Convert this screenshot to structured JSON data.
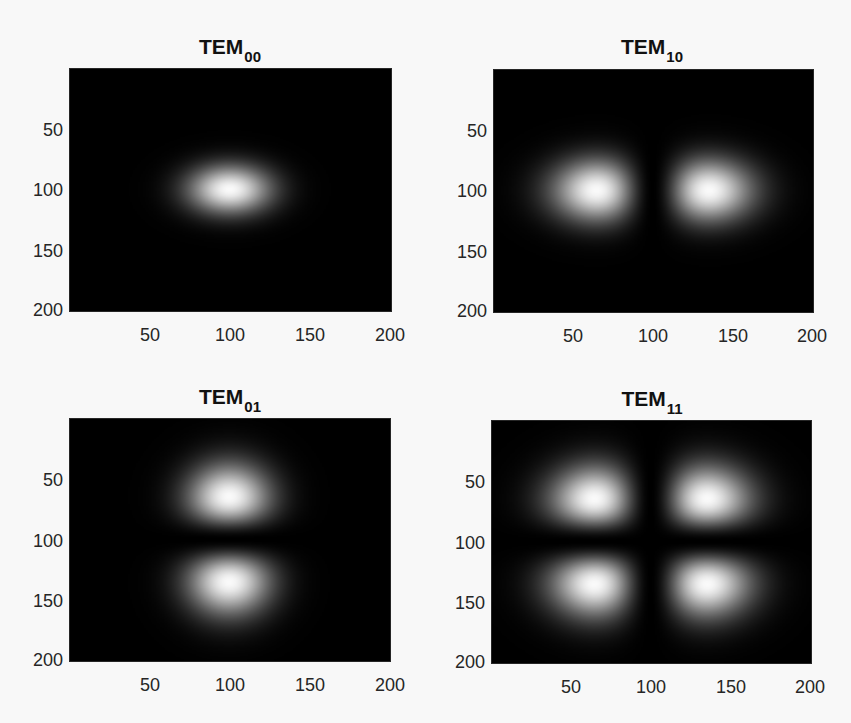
{
  "figure": {
    "background": "#f8f8f8",
    "colormap": "gray"
  },
  "chart_data": [
    {
      "type": "heatmap",
      "title": "TEM00",
      "title_main": "TEM",
      "title_sub": "00",
      "mode": {
        "m": 0,
        "n": 0
      },
      "xlabel": "",
      "ylabel": "",
      "xlim": [
        0.5,
        200.5
      ],
      "ylim": [
        0.5,
        200.5
      ],
      "y_reversed": true,
      "xticks": [
        50,
        100,
        150,
        200
      ],
      "yticks": [
        50,
        100,
        150,
        200
      ],
      "xtick_labels": [
        "50",
        "100",
        "150",
        "200"
      ],
      "ytick_labels": [
        "50",
        "100",
        "150",
        "200"
      ],
      "center": [
        100,
        100
      ],
      "waist_x": 36,
      "waist_y": 28,
      "intensity_peaks": [
        {
          "x": 100,
          "y": 100
        }
      ],
      "grid": false
    },
    {
      "type": "heatmap",
      "title": "TEM10",
      "title_main": "TEM",
      "title_sub": "10",
      "mode": {
        "m": 1,
        "n": 0
      },
      "xlabel": "",
      "ylabel": "",
      "xlim": [
        0.5,
        200.5
      ],
      "ylim": [
        0.5,
        200.5
      ],
      "y_reversed": true,
      "xticks": [
        50,
        100,
        150,
        200
      ],
      "yticks": [
        50,
        100,
        150,
        200
      ],
      "xtick_labels": [
        "50",
        "100",
        "150",
        "200"
      ],
      "ytick_labels": [
        "50",
        "100",
        "150",
        "200"
      ],
      "center": [
        100,
        100
      ],
      "waist_x": 50,
      "waist_y": 36,
      "intensity_peaks": [
        {
          "x": 65,
          "y": 100
        },
        {
          "x": 135,
          "y": 100
        }
      ],
      "grid": false
    },
    {
      "type": "heatmap",
      "title": "TEM01",
      "title_main": "TEM",
      "title_sub": "01",
      "mode": {
        "m": 0,
        "n": 1
      },
      "xlabel": "",
      "ylabel": "",
      "xlim": [
        0.5,
        200.5
      ],
      "ylim": [
        0.5,
        200.5
      ],
      "y_reversed": true,
      "xticks": [
        50,
        100,
        150,
        200
      ],
      "yticks": [
        50,
        100,
        150,
        200
      ],
      "xtick_labels": [
        "50",
        "100",
        "150",
        "200"
      ],
      "ytick_labels": [
        "50",
        "100",
        "150",
        "200"
      ],
      "center": [
        100,
        100
      ],
      "waist_x": 36,
      "waist_y": 50,
      "intensity_peaks": [
        {
          "x": 100,
          "y": 65
        },
        {
          "x": 100,
          "y": 135
        }
      ],
      "grid": false
    },
    {
      "type": "heatmap",
      "title": "TEM11",
      "title_main": "TEM",
      "title_sub": "11",
      "mode": {
        "m": 1,
        "n": 1
      },
      "xlabel": "",
      "ylabel": "",
      "xlim": [
        0.5,
        200.5
      ],
      "ylim": [
        0.5,
        200.5
      ],
      "y_reversed": true,
      "xticks": [
        50,
        100,
        150,
        200
      ],
      "yticks": [
        50,
        100,
        150,
        200
      ],
      "xtick_labels": [
        "50",
        "100",
        "150",
        "200"
      ],
      "ytick_labels": [
        "50",
        "100",
        "150",
        "200"
      ],
      "center": [
        100,
        100
      ],
      "waist_x": 50,
      "waist_y": 50,
      "intensity_peaks": [
        {
          "x": 65,
          "y": 65
        },
        {
          "x": 135,
          "y": 65
        },
        {
          "x": 65,
          "y": 135
        },
        {
          "x": 135,
          "y": 135
        }
      ],
      "grid": false
    }
  ]
}
